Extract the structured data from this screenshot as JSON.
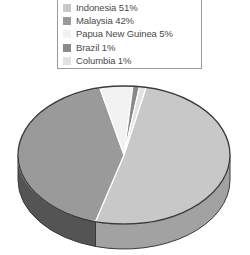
{
  "chart_data": {
    "type": "pie",
    "title": "",
    "subtitle": "",
    "xlabel": "",
    "ylabel": "",
    "legend_position": "top",
    "grid": false,
    "three_d": true,
    "categories": [
      "Indonesia",
      "Malaysia",
      "Papua New Guinea",
      "Brazil",
      "Columbia"
    ],
    "values": [
      51,
      42,
      5,
      1,
      1
    ],
    "value_unit": "%",
    "labels": [
      "Indonesia 51%",
      "Malaysia 42%",
      "Papua New Guinea 5%",
      "Brazil 1%",
      "Columbia 1%"
    ],
    "colors": [
      "#c8c8c8",
      "#9a9a9a",
      "#f2f2f2",
      "#8a8a8a",
      "#e2e2e2"
    ],
    "side_colors": [
      "#a2a2a2",
      "#545454",
      "#cfcfcf",
      "#606060",
      "#bdbdbd"
    ],
    "outline_color": "#3a3a3a"
  },
  "legend": {
    "name": "chart-legend",
    "border_color": "#9a9a9a",
    "items": [
      {
        "label": "Indonesia 51%",
        "name": "Indonesia",
        "value": 51,
        "color": "#c8c8c8"
      },
      {
        "label": "Malaysia 42%",
        "name": "Malaysia",
        "value": 42,
        "color": "#9a9a9a"
      },
      {
        "label": "Papua New Guinea 5%",
        "name": "Papua New Guinea",
        "value": 5,
        "color": "#f2f2f2"
      },
      {
        "label": "Brazil 1%",
        "name": "Brazil",
        "value": 1,
        "color": "#8a8a8a"
      },
      {
        "label": "Columbia 1%",
        "name": "Columbia",
        "value": 1,
        "color": "#e2e2e2"
      }
    ]
  }
}
